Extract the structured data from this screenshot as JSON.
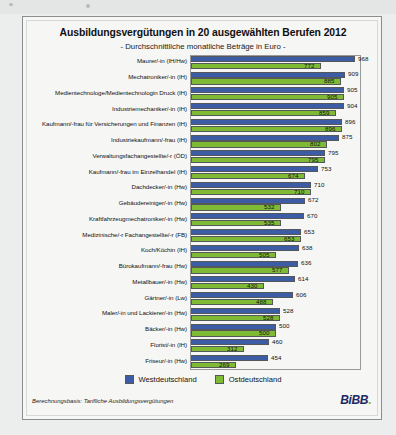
{
  "credit_side": "Grafik: Bundesinstitut für Berufsbildung (BIBB)",
  "card": {
    "title": "Ausbildungsvergütungen in 20 ausgewählten Berufen 2012",
    "subtitle": "- Durchschnittliche monatliche Beträge in Euro -",
    "footnote": "Berechnungsbasis: Tarifliche Ausbildungsvergütungen",
    "logo_text": "BiBB",
    "logo_dot": "."
  },
  "legend": {
    "west_label": "Westdeutschland",
    "east_label": "Ostdeutschland",
    "west_color": "#3c5ca6",
    "east_color": "#7fba35"
  },
  "chart_data": {
    "type": "bar",
    "orientation": "horizontal",
    "title": "Ausbildungsvergütungen in 20 ausgewählten Berufen 2012",
    "subtitle": "- Durchschnittliche monatliche Beträge in Euro -",
    "xlabel": "",
    "ylabel": "",
    "unit": "Euro",
    "xlim": [
      0,
      1000
    ],
    "grid": false,
    "legend_position": "bottom-center",
    "categories": [
      "Maurer/-in (IH/Hw)",
      "Mechatroniker/-in (IH)",
      "Medientechnologe/Medientechnologin Druck (IH)",
      "Industriemechaniker/-in (IH)",
      "Kaufmann/-frau für Versicherungen und Finanzen (IH)",
      "Industriekaufmann/-frau (IH)",
      "Verwaltungsfachangestellte/-r (ÖD)",
      "Kaufmann/-frau im Einzelhandel (IH)",
      "Dachdecker/-in (Hw)",
      "Gebäudereiniger/-in (Hw)",
      "Kraftfahrzeugmechatroniker/-in (Hw)",
      "Medizinische/-r Fachangestellte/-r (FB)",
      "Koch/Köchin (IH)",
      "Bürokaufmann/-frau (Hw)",
      "Metallbauer/-in (Hw)",
      "Gärtner/-in (Lw)",
      "Maler/-in und Lackierer/-in (Hw)",
      "Bäcker/-in (Hw)",
      "Florist/-in (IH)",
      "Friseur/-in (Hw)"
    ],
    "series": [
      {
        "name": "Westdeutschland",
        "color": "#3c5ca6",
        "values": [
          968,
          909,
          905,
          904,
          896,
          875,
          795,
          753,
          710,
          672,
          670,
          653,
          638,
          636,
          614,
          606,
          528,
          500,
          460,
          454
        ]
      },
      {
        "name": "Ostdeutschland",
        "color": "#7fba35",
        "values": [
          772,
          885,
          905,
          859,
          896,
          802,
          795,
          674,
          710,
          532,
          535,
          653,
          505,
          577,
          430,
          488,
          528,
          500,
          312,
          269
        ]
      }
    ]
  }
}
